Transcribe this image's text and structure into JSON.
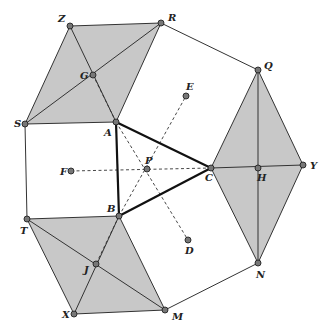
{
  "diagram": {
    "colors": {
      "fill": "#c8c8c8",
      "stroke": "#333333",
      "thick_stroke": "#111111",
      "point_fill": "#777777",
      "background": "#ffffff"
    },
    "points": {
      "Z": {
        "label": "Z",
        "x": 70,
        "y": 26,
        "lx": 58,
        "ly": 22
      },
      "R": {
        "label": "R",
        "x": 161,
        "y": 23,
        "lx": 168,
        "ly": 21
      },
      "G": {
        "label": "G",
        "x": 93,
        "y": 75,
        "lx": 80,
        "ly": 79
      },
      "S": {
        "label": "S",
        "x": 25,
        "y": 124,
        "lx": 14,
        "ly": 127
      },
      "A": {
        "label": "A",
        "x": 116,
        "y": 122,
        "lx": 104,
        "ly": 136
      },
      "E": {
        "label": "E",
        "x": 186,
        "y": 96,
        "lx": 186,
        "ly": 90
      },
      "P": {
        "label": "P",
        "x": 147,
        "y": 169,
        "lx": 145,
        "ly": 164
      },
      "F": {
        "label": "F",
        "x": 71,
        "y": 171,
        "lx": 60,
        "ly": 175
      },
      "C": {
        "label": "C",
        "x": 211,
        "y": 168,
        "lx": 205,
        "ly": 181
      },
      "Q": {
        "label": "Q",
        "x": 258,
        "y": 70,
        "lx": 264,
        "ly": 69
      },
      "H": {
        "label": "H",
        "x": 258,
        "y": 168,
        "lx": 257,
        "ly": 181
      },
      "Y": {
        "label": "Y",
        "x": 303,
        "y": 165,
        "lx": 310,
        "ly": 169
      },
      "N": {
        "label": "N",
        "x": 258,
        "y": 263,
        "lx": 256,
        "ly": 278
      },
      "T": {
        "label": "T",
        "x": 27,
        "y": 219,
        "lx": 20,
        "ly": 234
      },
      "B": {
        "label": "B",
        "x": 119,
        "y": 216,
        "lx": 107,
        "ly": 212
      },
      "J": {
        "label": "J",
        "x": 96,
        "y": 264,
        "lx": 84,
        "ly": 273
      },
      "X": {
        "label": "X",
        "x": 74,
        "y": 314,
        "lx": 62,
        "ly": 318
      },
      "M": {
        "label": "M",
        "x": 165,
        "y": 310,
        "lx": 172,
        "ly": 320
      },
      "D": {
        "label": "D",
        "x": 188,
        "y": 240,
        "lx": 185,
        "ly": 254
      }
    },
    "shaded_polygons": [
      {
        "name": "rhombus-ZRAS",
        "points": [
          "Z",
          "R",
          "A",
          "S"
        ]
      },
      {
        "name": "kite-QYNC",
        "points": [
          "Q",
          "Y",
          "N",
          "C"
        ]
      },
      {
        "name": "rhombus-TBMX",
        "points": [
          "T",
          "B",
          "M",
          "X"
        ]
      }
    ],
    "thin_segments": [
      [
        "Z",
        "A"
      ],
      [
        "S",
        "R"
      ],
      [
        "Q",
        "N"
      ],
      [
        "C",
        "Y"
      ],
      [
        "T",
        "M"
      ],
      [
        "X",
        "B"
      ],
      [
        "R",
        "Q"
      ],
      [
        "N",
        "M"
      ],
      [
        "S",
        "T"
      ]
    ],
    "thick_segments": [
      [
        "A",
        "B"
      ],
      [
        "B",
        "C"
      ],
      [
        "C",
        "A"
      ]
    ],
    "dashed_segments": [
      [
        "F",
        "C"
      ],
      [
        "B",
        "E"
      ],
      [
        "A",
        "D"
      ],
      [
        "G",
        "A"
      ],
      [
        "B",
        "J"
      ]
    ]
  }
}
